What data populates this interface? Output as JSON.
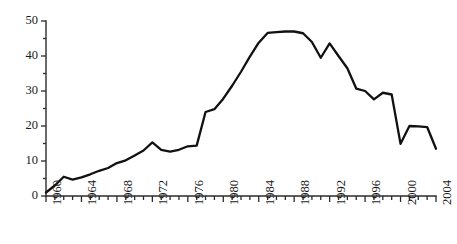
{
  "chart_data": {
    "type": "line",
    "title": "",
    "subtitle": "",
    "xlabel": "",
    "ylabel": "",
    "xlim": [
      1960,
      2004
    ],
    "ylim": [
      0,
      50
    ],
    "grid": false,
    "legend": null,
    "legend_position": "none",
    "series_color": "#111111",
    "background_color": "#ffffff",
    "axis_color": "#2b2b2b",
    "y_ticks_major": [
      0,
      10,
      20,
      30,
      40,
      50
    ],
    "y_tick_labels": [
      "0",
      "10",
      "20",
      "30",
      "40",
      "50"
    ],
    "y_tick_minor_step": 5,
    "x_tick_step": 1,
    "x_tick_label_step": 4,
    "x_tick_labels": [
      "1960",
      "1964",
      "1968",
      "1972",
      "1976",
      "1980",
      "1984",
      "1988",
      "1992",
      "1996",
      "2000",
      "2004"
    ],
    "x": [
      1960,
      1961,
      1962,
      1963,
      1964,
      1965,
      1966,
      1967,
      1968,
      1969,
      1970,
      1971,
      1972,
      1973,
      1974,
      1975,
      1976,
      1977,
      1978,
      1979,
      1980,
      1981,
      1982,
      1983,
      1984,
      1985,
      1986,
      1987,
      1988,
      1989,
      1990,
      1991,
      1992,
      1993,
      1994,
      1995,
      1996,
      1997,
      1998,
      1999,
      2000,
      2001,
      2002,
      2003,
      2004
    ],
    "values": [
      1.0,
      3.0,
      5.5,
      4.7,
      5.3,
      6.2,
      7.2,
      8.0,
      9.4,
      10.2,
      11.6,
      13.0,
      15.3,
      13.2,
      12.7,
      13.2,
      14.2,
      14.4,
      24.0,
      24.8,
      27.8,
      31.5,
      35.5,
      39.8,
      43.8,
      46.6,
      46.8,
      47.0,
      47.0,
      46.5,
      44.0,
      39.5,
      43.6,
      40.0,
      36.5,
      30.7,
      30.0,
      27.6,
      29.5,
      29.0,
      14.9,
      20.0,
      19.9,
      19.7,
      13.5
    ],
    "geometry": {
      "plot_left": 46,
      "plot_right": 436,
      "plot_top": 21,
      "plot_bottom": 196
    }
  }
}
